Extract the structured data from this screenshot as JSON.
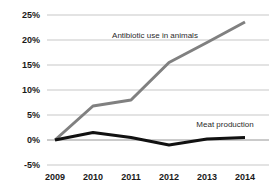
{
  "chart_data": {
    "type": "line",
    "title": "",
    "xlabel": "",
    "ylabel": "",
    "categories": [
      "2009",
      "2010",
      "2011",
      "2012",
      "2013",
      "2014"
    ],
    "ylim": [
      -5,
      25
    ],
    "yticks": [
      "-5%",
      "0%",
      "5%",
      "10%",
      "15%",
      "20%",
      "25%"
    ],
    "ytick_values": [
      -5,
      0,
      5,
      10,
      15,
      20,
      25
    ],
    "grid": true,
    "legend_position": "inline-labels",
    "series": [
      {
        "name": "Antibiotic use in animals",
        "color": "#808080",
        "values": [
          0,
          6.8,
          8,
          15.5,
          19.5,
          23.6
        ],
        "label_x": "2011",
        "label_text": "Antibiotic use in animals"
      },
      {
        "name": "Meat production",
        "color": "#111111",
        "values": [
          0,
          1.5,
          0.5,
          -1,
          0.2,
          0.5
        ],
        "label_x": "2013",
        "label_text": "Meat production"
      }
    ],
    "annotations": [
      {
        "text": "Antibiotic use in animals",
        "series": "Antibiotic use in animals"
      },
      {
        "text": "Meat production",
        "series": "Meat production"
      }
    ],
    "colors": {
      "background": "#ffffff",
      "gridline": "#b9b9b9",
      "axis": "#8a8a8a",
      "tick_text": "#1a1a1a",
      "annotation_text": "#2b2b2b"
    }
  },
  "ticks": {
    "y": [
      {
        "label": "25%",
        "value": 25
      },
      {
        "label": "20%",
        "value": 20
      },
      {
        "label": "15%",
        "value": 15
      },
      {
        "label": "10%",
        "value": 10
      },
      {
        "label": "5%",
        "value": 5
      },
      {
        "label": "0%",
        "value": 0
      },
      {
        "label": "-5%",
        "value": -5
      }
    ],
    "x": [
      {
        "label": "2009"
      },
      {
        "label": "2010"
      },
      {
        "label": "2011"
      },
      {
        "label": "2012"
      },
      {
        "label": "2013"
      },
      {
        "label": "2014"
      }
    ]
  },
  "labels": {
    "series_gray": "Antibiotic use in animals",
    "series_black": "Meat production"
  }
}
